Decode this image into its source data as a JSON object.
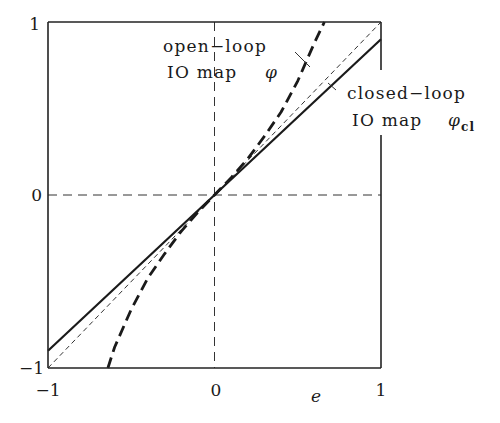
{
  "chart_data": {
    "type": "line",
    "title": "",
    "xlabel": "e",
    "ylabel": "",
    "xlim": [
      -1,
      1
    ],
    "ylim": [
      -1,
      1
    ],
    "grid": false,
    "x_ticks": [
      "-1",
      "0",
      "1"
    ],
    "y_ticks": [
      "-1",
      "0",
      "1"
    ],
    "reference_lines": [
      {
        "name": "zero-x",
        "style": "dashed",
        "x": 0
      },
      {
        "name": "zero-y",
        "style": "dashed",
        "y": 0
      }
    ],
    "series": [
      {
        "name": "identity",
        "style": "thin-dashed",
        "x": [
          -1,
          1
        ],
        "y": [
          -1,
          1
        ]
      },
      {
        "name": "open-loop IO map φ",
        "style": "bold-dashed",
        "x": [
          -0.64,
          -0.6,
          -0.5,
          -0.4,
          -0.3,
          -0.2,
          -0.1,
          0,
          0.1,
          0.2,
          0.3,
          0.4,
          0.5,
          0.6,
          0.66
        ],
        "y": [
          -1.0,
          -0.88,
          -0.66,
          -0.48,
          -0.34,
          -0.21,
          -0.1,
          0,
          0.1,
          0.21,
          0.34,
          0.48,
          0.66,
          0.88,
          1.0
        ]
      },
      {
        "name": "closed-loop IO map φcl",
        "style": "solid",
        "x": [
          -1,
          1
        ],
        "y": [
          -0.9,
          0.9
        ]
      }
    ],
    "annotations": [
      {
        "line1": "open−loop",
        "line2": "IO map",
        "symbol": "φ",
        "points_to": "open-loop IO map φ"
      },
      {
        "line1": "closed−loop",
        "line2": "IO map",
        "symbol": "φ",
        "subscript": "cl",
        "points_to": "closed-loop IO map φcl"
      }
    ]
  },
  "axes": {
    "x_tick_neg": "−1",
    "x_tick_zero": "0",
    "x_tick_pos": "1",
    "y_tick_neg": "−1",
    "y_tick_zero": "0",
    "y_tick_pos": "1",
    "xlabel": "e"
  },
  "labels": {
    "open_line1": "open−loop",
    "open_line2": "IO map",
    "open_symbol": "φ",
    "closed_line1": "closed−loop",
    "closed_line2": "IO map",
    "closed_symbol": "φ",
    "closed_sub": "cl"
  }
}
